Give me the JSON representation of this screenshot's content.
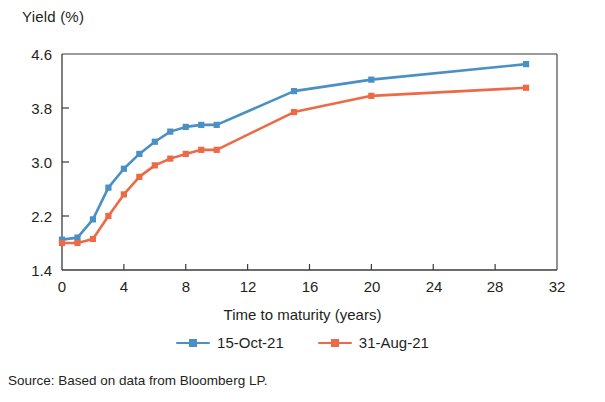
{
  "chart_data": {
    "type": "line",
    "title": "",
    "xlabel": "Time to maturity (years)",
    "ylabel": "Yield (%)",
    "xlim": [
      0,
      32
    ],
    "ylim": [
      1.4,
      4.6
    ],
    "xticks": [
      0,
      4,
      8,
      12,
      16,
      20,
      24,
      28,
      32
    ],
    "xtick_labels": [
      "0",
      "4",
      "8",
      "12",
      "16",
      "20",
      "24",
      "28",
      "32"
    ],
    "yticks": [
      1.4,
      2.2,
      3.0,
      3.8,
      4.6
    ],
    "ytick_labels": [
      "1.4",
      "2.2",
      "3.0",
      "3.8",
      "4.6"
    ],
    "grid": false,
    "legend_position": "bottom-center",
    "x": [
      0,
      1,
      2,
      3,
      4,
      5,
      6,
      7,
      8,
      9,
      10,
      15,
      20,
      30
    ],
    "series": [
      {
        "name": "15-Oct-21",
        "color": "#4a90c4",
        "marker": "square",
        "values": [
          1.85,
          1.88,
          2.15,
          2.62,
          2.9,
          3.12,
          3.3,
          3.45,
          3.52,
          3.55,
          3.55,
          4.05,
          4.22,
          4.45
        ]
      },
      {
        "name": "31-Aug-21",
        "color": "#ec6a45",
        "marker": "square",
        "values": [
          1.8,
          1.8,
          1.86,
          2.2,
          2.52,
          2.78,
          2.95,
          3.05,
          3.12,
          3.18,
          3.18,
          3.74,
          3.98,
          4.1
        ]
      }
    ]
  },
  "axes": {
    "y_axis_title": "Yield (%)",
    "x_axis_title": "Time to maturity (years)",
    "y_tick_labels": [
      "4.6",
      "3.8",
      "3.0",
      "2.2",
      "1.4"
    ],
    "x_tick_labels": [
      "0",
      "4",
      "8",
      "12",
      "16",
      "20",
      "24",
      "28",
      "32"
    ]
  },
  "legend": {
    "items": [
      {
        "label": "15-Oct-21",
        "color": "#4a90c4"
      },
      {
        "label": "31-Aug-21",
        "color": "#ec6a45"
      }
    ]
  },
  "footer": {
    "source": "Source: Based on data from Bloomberg LP."
  },
  "colors": {
    "series_1": "#4a90c4",
    "series_2": "#ec6a45",
    "axis": "#3a3a3a",
    "text": "#231f20"
  }
}
